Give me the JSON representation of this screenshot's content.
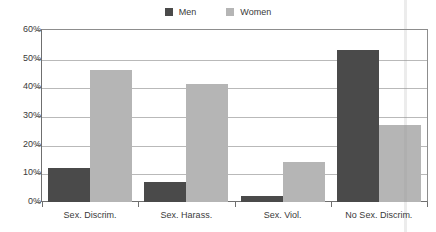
{
  "chart_data": {
    "type": "bar",
    "title": "",
    "xlabel": "",
    "ylabel": "",
    "ylim": [
      0,
      60
    ],
    "ytick_labels": [
      "0%",
      "10%",
      "20%",
      "30%",
      "40%",
      "50%",
      "60%"
    ],
    "ytick_values": [
      0,
      10,
      20,
      30,
      40,
      50,
      60
    ],
    "grid": true,
    "legend_position": "top-center",
    "categories": [
      "Sex. Discrim.",
      "Sex. Harass.",
      "Sex. Viol.",
      "No Sex. Discrim."
    ],
    "series": [
      {
        "name": "Men",
        "color": "#4a4a4a",
        "values": [
          12,
          7,
          2,
          53
        ]
      },
      {
        "name": "Women",
        "color": "#b5b5b5",
        "values": [
          46,
          41,
          14,
          27
        ]
      }
    ]
  },
  "legend": {
    "items": [
      {
        "label": "Men",
        "swatch_name": "legend-swatch-men"
      },
      {
        "label": "Women",
        "swatch_name": "legend-swatch-women"
      }
    ]
  },
  "colors": {
    "men": "#4a4a4a",
    "women": "#b5b5b5",
    "gridline": "#b9b9b9",
    "axis": "#6f6f6f",
    "text": "#3a3a3a",
    "background": "#ffffff"
  }
}
